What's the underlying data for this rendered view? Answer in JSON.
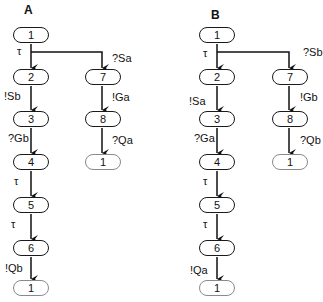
{
  "panels": [
    {
      "title": "A",
      "nodes": {
        "n1": "1",
        "n2": "2",
        "n3": "3",
        "n4": "4",
        "n5": "5",
        "n6": "6",
        "n_end_left": "1",
        "n7": "7",
        "n8": "8",
        "n_end_right": "1"
      },
      "edges": {
        "e1_2": "τ",
        "e1_7": "?Sa",
        "e2_3": "!Sb",
        "e3_4": "?Gb",
        "e4_5": "τ",
        "e5_6": "τ",
        "e6_end": "!Qb",
        "e7_8": "!Ga",
        "e8_end": "?Qa"
      }
    },
    {
      "title": "B",
      "nodes": {
        "n1": "1",
        "n2": "2",
        "n3": "3",
        "n4": "4",
        "n5": "5",
        "n6": "6",
        "n_end_left": "1",
        "n7": "7",
        "n8": "8",
        "n_end_right": "1"
      },
      "edges": {
        "e1_2": "τ",
        "e1_7": "?Sb",
        "e2_3": "!Sa",
        "e3_4": "?Ga",
        "e4_5": "τ",
        "e5_6": "τ",
        "e6_end": "!Qa",
        "e7_8": "!Gb",
        "e8_end": "?Qb"
      }
    }
  ]
}
